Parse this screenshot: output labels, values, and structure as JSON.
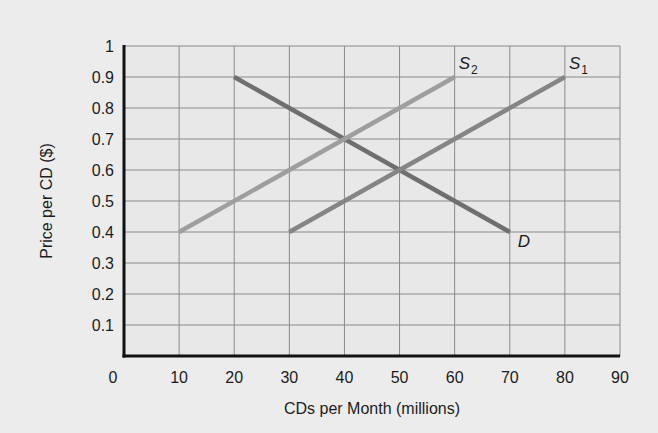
{
  "chart_data": {
    "type": "line",
    "title": "",
    "xlabel": "CDs per Month (millions)",
    "ylabel": "Price per CD ($)",
    "xlim": [
      0,
      90
    ],
    "ylim": [
      0,
      1
    ],
    "x_ticks": [
      "0",
      "10",
      "20",
      "30",
      "40",
      "50",
      "60",
      "70",
      "80",
      "90"
    ],
    "y_ticks": [
      "0.1",
      "0.2",
      "0.3",
      "0.4",
      "0.5",
      "0.6",
      "0.7",
      "0.8",
      "0.9",
      "1"
    ],
    "grid": true,
    "legend": "inline curve labels",
    "series": [
      {
        "name": "D",
        "label": "D",
        "subscript": "",
        "points": [
          [
            20,
            0.9
          ],
          [
            70,
            0.4
          ]
        ],
        "color": "#6f6f6f",
        "label_pos": "below-right of end"
      },
      {
        "name": "S1",
        "label": "S",
        "subscript": "1",
        "points": [
          [
            30,
            0.4
          ],
          [
            80,
            0.9
          ]
        ],
        "color": "#858585",
        "label_pos": "above-right of end"
      },
      {
        "name": "S2",
        "label": "S",
        "subscript": "2",
        "points": [
          [
            10,
            0.4
          ],
          [
            60,
            0.9
          ]
        ],
        "color": "#9e9e9e",
        "label_pos": "above-right of end"
      }
    ],
    "intersections": [
      {
        "curves": [
          "D",
          "S2"
        ],
        "x": 40,
        "y": 0.7
      },
      {
        "curves": [
          "D",
          "S1"
        ],
        "x": 50,
        "y": 0.6
      }
    ]
  },
  "colors": {
    "background": "#ececec",
    "plot_background": "#e8e8e8",
    "grid": "#8a8a8a",
    "axis": "#111111",
    "text": "#1c1c1c"
  }
}
